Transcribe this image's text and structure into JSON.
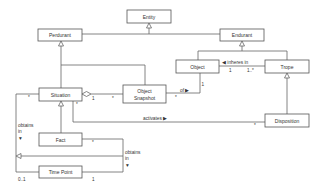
{
  "diagram": {
    "type": "uml-class-diagram",
    "classes": {
      "entity": "Entity",
      "perdurant": "Perdurant",
      "endurant": "Endurant",
      "object": "Object",
      "trope": "Trope",
      "situation": "Situation",
      "object_snapshot_line1": "Object",
      "object_snapshot_line2": "Snapshot",
      "disposition": "Disposition",
      "fact": "Fact",
      "time_point": "Time Point"
    },
    "relations": {
      "inheres_in": "◀ inheres in",
      "of": "of ▶",
      "activates": "activates ▶",
      "obtains_in_left_1": "obtains",
      "obtains_in_left_2": "in",
      "obtains_in_left_arrow": "▼",
      "obtains_in_right_1": "obtains",
      "obtains_in_right_2": "in",
      "obtains_in_right_arrow": "▼"
    },
    "multiplicities": {
      "inheres_object": "1",
      "inheres_trope": "1..*",
      "object_of": "1",
      "snapshot_of": "*",
      "situation_agg_whole": "1",
      "situation_agg_part": "*",
      "situation_left": "*",
      "situation_activates": "*",
      "disposition_activates": "*",
      "fact_obtains": "*",
      "timepoint_left": "0..1",
      "timepoint_right": "1"
    }
  }
}
